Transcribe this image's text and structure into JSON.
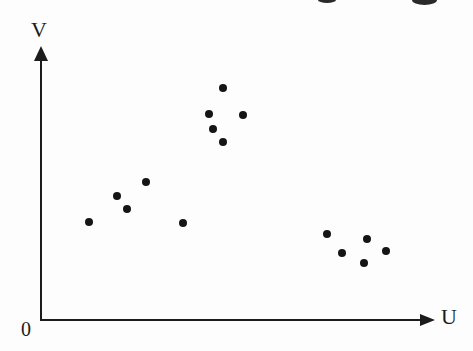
{
  "figure": {
    "background": "#fdfdfd",
    "ink_color": "#1c1c1c",
    "dot_color": "#151515",
    "y_axis_label": "V",
    "x_axis_label": "U",
    "origin_label": "0"
  },
  "artifacts": {
    "description": "partial glyph fragments of a cropped text line at the top edge of the scan",
    "fragments": [
      {
        "x": 318,
        "y": 0,
        "w": 18,
        "h": 3
      },
      {
        "x": 412,
        "y": 0,
        "w": 25,
        "h": 5
      }
    ]
  },
  "chart_data": {
    "type": "scatter",
    "title": "",
    "xlabel": "U",
    "ylabel": "V",
    "origin_label": "0",
    "xlim": [
      0,
      10
    ],
    "ylim": [
      0,
      10
    ],
    "grid": false,
    "legend": false,
    "tick_labels": "none (only origin labeled 0)",
    "marker": {
      "shape": "filled-circle",
      "color": "#151515",
      "diameter_px": 8
    },
    "series": [
      {
        "name": "upper-middle cluster",
        "points_uv": [
          [
            4.6,
            8.5
          ],
          [
            4.3,
            7.5
          ],
          [
            5.2,
            7.5
          ],
          [
            4.4,
            7.0
          ],
          [
            4.6,
            6.5
          ]
        ]
      },
      {
        "name": "left cluster",
        "points_uv": [
          [
            2.7,
            5.1
          ],
          [
            2.0,
            4.5
          ],
          [
            2.2,
            4.1
          ],
          [
            1.2,
            3.6
          ],
          [
            3.6,
            3.6
          ]
        ]
      },
      {
        "name": "lower-right cluster",
        "points_uv": [
          [
            7.3,
            3.2
          ],
          [
            8.3,
            3.0
          ],
          [
            7.7,
            2.5
          ],
          [
            8.8,
            2.5
          ],
          [
            8.2,
            2.1
          ]
        ]
      }
    ],
    "points_px": [
      [
        223,
        88
      ],
      [
        209,
        114
      ],
      [
        243,
        115
      ],
      [
        213,
        129
      ],
      [
        223,
        142
      ],
      [
        146,
        182
      ],
      [
        117,
        196
      ],
      [
        127,
        209
      ],
      [
        89,
        222
      ],
      [
        183,
        223
      ],
      [
        327,
        234
      ],
      [
        367,
        239
      ],
      [
        342,
        253
      ],
      [
        386,
        251
      ],
      [
        364,
        263
      ]
    ]
  }
}
